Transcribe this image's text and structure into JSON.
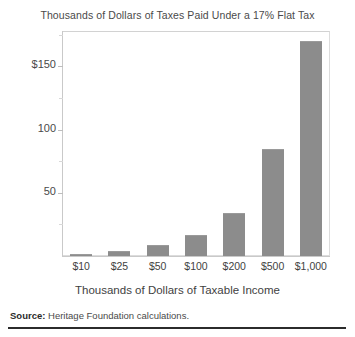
{
  "chart_data": {
    "type": "bar",
    "title": "Thousands of Dollars of Taxes Paid Under a 17% Flat Tax",
    "xlabel": "Thousands of Dollars of Taxable Income",
    "ylabel": "",
    "categories": [
      "$10",
      "$25",
      "$50",
      "$100",
      "$200",
      "$500",
      "$1,000"
    ],
    "values": [
      1.7,
      4.25,
      8.5,
      17,
      34,
      85,
      170
    ],
    "ylim": [
      0,
      178
    ],
    "y_ticks": [
      50,
      100,
      150
    ],
    "y_tick_labels": [
      "50",
      "100",
      "$150"
    ],
    "y_minor_ticks": [
      25,
      75,
      125,
      175
    ],
    "grid": false,
    "legend": null,
    "bar_color": "#8c8c8c"
  },
  "footer": {
    "source_label": "Source:",
    "source_text": " Heritage Foundation calculations."
  }
}
